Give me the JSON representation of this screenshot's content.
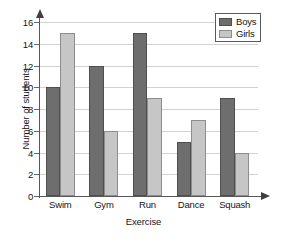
{
  "chart_data": {
    "type": "bar",
    "title": "",
    "subtitle": "",
    "xlabel": "Exercise",
    "ylabel": "Number of students",
    "categories": [
      "Swim",
      "Gym",
      "Run",
      "Dance",
      "Squash"
    ],
    "series": [
      {
        "name": "Boys",
        "values": [
          10,
          12,
          15,
          5,
          9
        ],
        "color": "#6e6e6e"
      },
      {
        "name": "Girls",
        "values": [
          15,
          6,
          9,
          7,
          4
        ],
        "color": "#c6c6c6"
      }
    ],
    "ylim": [
      0,
      16
    ],
    "ytick_step": 2,
    "yticks": [
      0,
      2,
      4,
      6,
      8,
      10,
      12,
      14,
      16
    ],
    "ytick_labels": [
      "0",
      "2",
      "4",
      "6",
      "8",
      "10",
      "12",
      "14",
      "16"
    ],
    "grid": true,
    "grid_axis": "y",
    "legend_position": "top-right",
    "legend_entries": [
      "Boys",
      "Girls"
    ],
    "axis_arrows": true,
    "background": "#ffffff"
  },
  "legend": {
    "boys_label": "Boys",
    "girls_label": "Girls"
  },
  "axes": {
    "x_title": "Exercise",
    "y_title": "Number of students"
  }
}
